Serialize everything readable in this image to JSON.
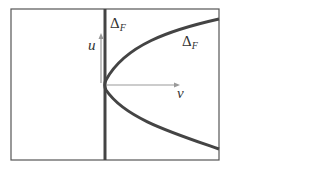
{
  "diagram": {
    "labels": {
      "delta_vertical": {
        "main": "Δ",
        "sub": "F"
      },
      "delta_curve": {
        "main": "Δ",
        "sub": "F"
      },
      "u_axis": "u",
      "v_axis": "v"
    },
    "colors": {
      "frame": "#555555",
      "curve": "#444444",
      "axis": "#999999"
    }
  }
}
